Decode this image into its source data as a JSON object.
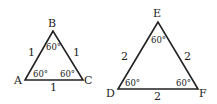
{
  "triangles": [
    {
      "name": "ABC",
      "vertices": {
        "top": "B",
        "left": "A",
        "right": "C"
      },
      "sides": {
        "left": "1",
        "right": "1",
        "bottom": "1"
      },
      "angles": {
        "top": "60°",
        "left": "60°",
        "right": "60°"
      }
    },
    {
      "name": "DEF",
      "vertices": {
        "top": "E",
        "left": "D",
        "right": "F"
      },
      "sides": {
        "left": "2",
        "right": "2",
        "bottom": "2"
      },
      "angles": {
        "top": "60°",
        "left": "60°",
        "right": "60°"
      }
    }
  ],
  "stroke_color": "#222222"
}
